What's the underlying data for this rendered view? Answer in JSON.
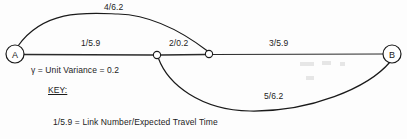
{
  "diagram": {
    "title_present": false,
    "background_color": "#fdfdfd",
    "stroke_color": "#1a1a1a",
    "nodes": [
      {
        "id": "A",
        "label": "A",
        "type": "terminal",
        "x": 15,
        "y": 54,
        "r": 9
      },
      {
        "id": "n1",
        "label": "",
        "type": "junction",
        "x": 157,
        "y": 55,
        "r": 3.6
      },
      {
        "id": "n2",
        "label": "",
        "type": "junction",
        "x": 209,
        "y": 54,
        "r": 3.6
      },
      {
        "id": "B",
        "label": "B",
        "type": "terminal",
        "x": 392,
        "y": 54,
        "r": 9
      }
    ],
    "edges": [
      {
        "id": "link-4",
        "label": "4/6.2",
        "from": "A",
        "to": "n2",
        "shape": "arc-above",
        "label_x": 118,
        "label_y": 3
      },
      {
        "id": "link-1",
        "label": "1/5.9",
        "from": "A",
        "to": "n1",
        "shape": "straight",
        "label_x": 95,
        "label_y": 41
      },
      {
        "id": "link-2",
        "label": "2/0.2",
        "from": "n1",
        "to": "n2",
        "shape": "straight",
        "label_x": 183,
        "label_y": 41
      },
      {
        "id": "link-3",
        "label": "3/5.9",
        "from": "n2",
        "to": "B",
        "shape": "straight",
        "label_x": 283,
        "label_y": 41
      },
      {
        "id": "link-5",
        "label": "5/6.2",
        "from": "n1",
        "to": "B",
        "shape": "arc-below",
        "label_x": 278,
        "label_y": 94
      }
    ],
    "annotations": {
      "variance_note": "γ = Unit Variance = 0.2",
      "key_heading": "KEY:",
      "legend_line": "1/5.9 = Link Number/Expected Travel Time"
    }
  }
}
